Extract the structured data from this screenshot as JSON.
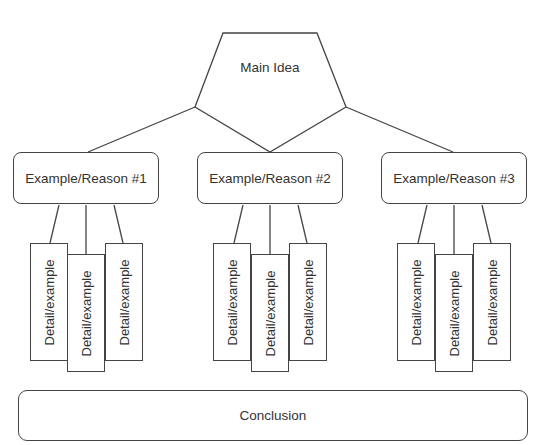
{
  "diagram": {
    "type": "graphic organizer / hierarchy",
    "main_idea": {
      "label": "Main Idea",
      "shape": "pentagon"
    },
    "reasons": [
      {
        "label": "Example/Reason #1",
        "details": [
          "Detail/example",
          "Detail/example",
          "Detail/example"
        ]
      },
      {
        "label": "Example/Reason #2",
        "details": [
          "Detail/example",
          "Detail/example",
          "Detail/example"
        ]
      },
      {
        "label": "Example/Reason #3",
        "details": [
          "Detail/example",
          "Detail/example",
          "Detail/example"
        ]
      }
    ],
    "conclusion": {
      "label": "Conclusion"
    },
    "colors": {
      "stroke": "#444444",
      "text": "#333333",
      "background": "#ffffff"
    }
  }
}
